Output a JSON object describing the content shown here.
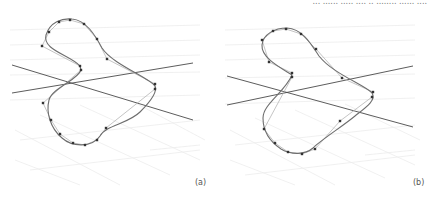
{
  "figure": {
    "top_cut_text": "... ...... ..... .... .. ........ ...... ....",
    "panels": [
      {
        "id": "a",
        "label": "(a)",
        "axes": [
          {
            "x1": 12,
            "y1": 65,
            "x2": 193,
            "y2": 120
          },
          {
            "x1": 12,
            "y1": 93,
            "x2": 193,
            "y2": 63
          }
        ],
        "control_points": [
          [
            42,
            46
          ],
          [
            49,
            32
          ],
          [
            59,
            22
          ],
          [
            70,
            20
          ],
          [
            84,
            24
          ],
          [
            97,
            39
          ],
          [
            107,
            59
          ],
          [
            155,
            84
          ],
          [
            155,
            89
          ],
          [
            106,
            128
          ],
          [
            97,
            140
          ],
          [
            85,
            145
          ],
          [
            73,
            143
          ],
          [
            60,
            134
          ],
          [
            51,
            120
          ],
          [
            43,
            103
          ],
          [
            81,
            70
          ],
          [
            80,
            66
          ]
        ],
        "curve_path": "M80,66 C70,55 42,50 46,35 C50,22 62,18 72,19 C86,20 95,35 102,48 C112,64 150,78 155,86 C158,92 150,102 140,112 C128,124 106,125 100,136 C92,148 72,147 62,138 C50,128 46,112 49,100 C52,88 78,80 81,70 Z",
        "polygon_path": "M80,66 L42,46 L49,32 L59,22 L70,20 L84,24 L97,39 L107,59 L155,84 L155,89 L106,128 L97,140 L85,145 L73,143 L60,134 L51,120 L43,103 L81,70"
      },
      {
        "id": "b",
        "label": "(b)",
        "axes": [
          {
            "x1": 12,
            "y1": 76,
            "x2": 198,
            "y2": 127
          },
          {
            "x1": 12,
            "y1": 105,
            "x2": 198,
            "y2": 66
          }
        ],
        "control_points": [
          [
            47,
            40
          ],
          [
            58,
            31
          ],
          [
            71,
            29
          ],
          [
            86,
            34
          ],
          [
            101,
            49
          ],
          [
            54,
            62
          ],
          [
            77,
            73
          ],
          [
            77,
            77
          ],
          [
            127,
            78
          ],
          [
            158,
            92
          ],
          [
            157,
            97
          ],
          [
            125,
            121
          ],
          [
            100,
            149
          ],
          [
            87,
            154
          ],
          [
            73,
            152
          ],
          [
            60,
            143
          ],
          [
            49,
            129
          ]
        ],
        "curve_path": "M77,75 C66,68 46,58 47,45 C48,34 60,28 72,28 C88,29 96,44 104,56 C118,74 150,85 157,93 C162,100 150,108 140,116 C128,126 106,140 98,148 C90,155 76,155 66,149 C54,141 48,130 48,118 C48,104 70,92 77,75 Z",
        "polygon_path": "M77,73 L54,62 L47,40 L58,31 L71,29 L86,34 L101,49 L127,78 L158,92 L157,97 L125,121 L100,149 L87,154 L73,152 L60,143 L49,129 L77,77"
      }
    ],
    "colors": {
      "axis_line": "#4a4a4a",
      "curve": "#6e6e6e",
      "control_polygon": "#b5b5b5",
      "control_point": "#333333",
      "grid": "#ececec",
      "label": "#555555"
    }
  }
}
